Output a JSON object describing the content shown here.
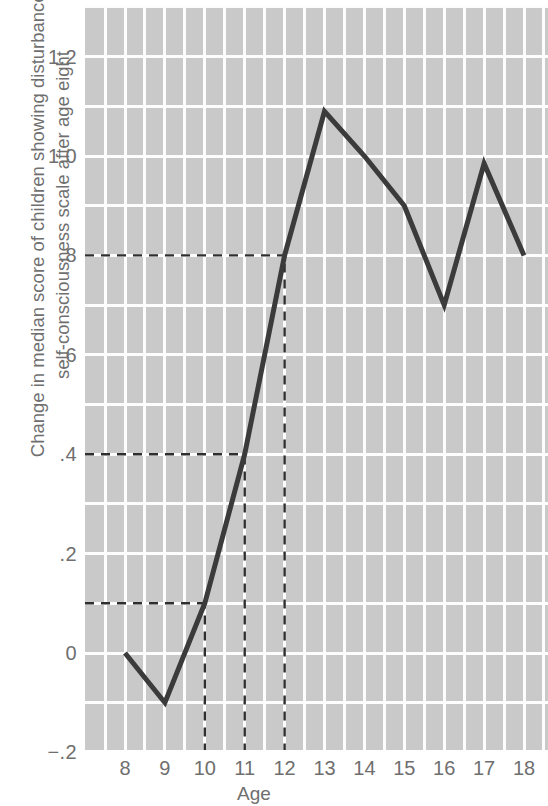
{
  "chart_data": {
    "type": "line",
    "title": "",
    "xlabel": "Age",
    "ylabel": "Change in median score of children showing disturbance in self-consciousness scale after age eight",
    "ylabel_line1": "Change in median score of children showing disturbance in",
    "ylabel_line2": "self-consciousness scale after age eight",
    "x": [
      8,
      9,
      10,
      11,
      12,
      13,
      14,
      15,
      16,
      17,
      18
    ],
    "values": [
      0.0,
      -0.1,
      0.1,
      0.4,
      0.8,
      1.09,
      1.0,
      0.9,
      0.7,
      0.985,
      0.8
    ],
    "categories": [
      "8",
      "9",
      "10",
      "11",
      "12",
      "13",
      "14",
      "15",
      "16",
      "17",
      "18"
    ],
    "xtick_labels": [
      "8",
      "9",
      "10",
      "11",
      "12",
      "13",
      "14",
      "15",
      "16",
      "17",
      "18"
    ],
    "ytick_labels": [
      "1.2",
      "1.0",
      ".8",
      ".6",
      ".4",
      ".2",
      "0",
      "−.2"
    ],
    "ytick_values": [
      1.2,
      1.0,
      0.8,
      0.6,
      0.4,
      0.2,
      0.0,
      -0.2
    ],
    "xlim": [
      7.5,
      18.5
    ],
    "ylim": [
      -0.2,
      1.3
    ],
    "grid": true,
    "legend": "none",
    "plot_background": "#c9c9c9",
    "grid_color": "#ffffff",
    "line_color": "#3b3b3b",
    "annotation_color": "#2e2e2e",
    "text_color": "#6f6f6f",
    "annotations": [
      {
        "name": "guide-0.1",
        "type": "horizontal-dashed",
        "y": 0.1,
        "x_from": 7.5,
        "x_to": 10
      },
      {
        "name": "guide-0.4",
        "type": "horizontal-dashed",
        "y": 0.4,
        "x_from": 7.5,
        "x_to": 11
      },
      {
        "name": "guide-0.8",
        "type": "horizontal-dashed",
        "y": 0.8,
        "x_from": 7.5,
        "x_to": 12
      },
      {
        "name": "guide-age-10",
        "type": "vertical-dashed",
        "x": 10,
        "y_from": -0.2,
        "y_to": 0.1
      },
      {
        "name": "guide-age-11",
        "type": "vertical-dashed",
        "x": 11,
        "y_from": -0.2,
        "y_to": 0.4
      },
      {
        "name": "guide-age-12",
        "type": "vertical-dashed",
        "x": 12,
        "y_from": -0.2,
        "y_to": 0.8
      }
    ]
  }
}
